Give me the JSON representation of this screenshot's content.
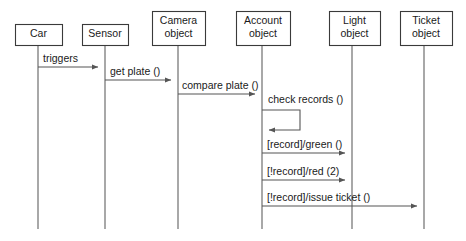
{
  "diagram": {
    "type": "uml-sequence-diagram",
    "title": "",
    "colors": {
      "background": "#ffffff",
      "box_stroke": "#3a3a3a",
      "lifeline_stroke": "#6e6e6e",
      "message_stroke": "#555555",
      "text": "#1a1a1a"
    },
    "participants": [
      {
        "id": "car",
        "label_lines": [
          "Car"
        ],
        "box": {
          "x": 15,
          "y": 24,
          "w": 47,
          "h": 21
        },
        "lifeline_x": 38,
        "lifeline_bottom": 229
      },
      {
        "id": "sensor",
        "label_lines": [
          "Sensor"
        ],
        "box": {
          "x": 82,
          "y": 24,
          "w": 46,
          "h": 21
        },
        "lifeline_x": 105,
        "lifeline_bottom": 229
      },
      {
        "id": "camera-object",
        "label_lines": [
          "Camera",
          "object"
        ],
        "box": {
          "x": 152,
          "y": 11,
          "w": 53,
          "h": 34
        },
        "lifeline_x": 178,
        "lifeline_bottom": 229
      },
      {
        "id": "account-object",
        "label_lines": [
          "Account",
          "object"
        ],
        "box": {
          "x": 236,
          "y": 11,
          "w": 54,
          "h": 34
        },
        "lifeline_x": 262,
        "lifeline_bottom": 229
      },
      {
        "id": "light-object",
        "label_lines": [
          "Light",
          "object"
        ],
        "box": {
          "x": 329,
          "y": 11,
          "w": 51,
          "h": 34
        },
        "lifeline_x": 352,
        "lifeline_bottom": 229
      },
      {
        "id": "ticket-object",
        "label_lines": [
          "Ticket",
          "object"
        ],
        "box": {
          "x": 400,
          "y": 11,
          "w": 52,
          "h": 34
        },
        "lifeline_x": 424,
        "lifeline_bottom": 229
      }
    ],
    "messages": [
      {
        "id": "msg-triggers",
        "label": "triggers",
        "from": "car",
        "to": "sensor",
        "from_x": 38,
        "to_x": 105,
        "y": 67,
        "label_x": 43,
        "label_y": 62,
        "kind": "call"
      },
      {
        "id": "msg-get-plate",
        "label": "get plate ()",
        "from": "sensor",
        "to": "camera-object",
        "from_x": 105,
        "to_x": 178,
        "y": 80,
        "label_x": 110,
        "label_y": 75,
        "kind": "call"
      },
      {
        "id": "msg-compare-plate",
        "label": "compare plate ()",
        "from": "camera-object",
        "to": "account-object",
        "from_x": 178,
        "to_x": 262,
        "y": 94,
        "label_x": 182,
        "label_y": 89,
        "kind": "call"
      },
      {
        "id": "msg-check-records",
        "label": "check records ()",
        "from": "account-object",
        "to": "account-object",
        "from_x": 262,
        "to_x": 262,
        "y": 110,
        "label_x": 268,
        "label_y": 103,
        "kind": "self",
        "loop_width": 38,
        "loop_height": 20
      },
      {
        "id": "msg-green",
        "label": "[record]/green ()",
        "from": "account-object",
        "to": "light-object",
        "from_x": 262,
        "to_x": 352,
        "y": 153,
        "label_x": 267,
        "label_y": 148,
        "kind": "call"
      },
      {
        "id": "msg-red",
        "label": "[!record]/red (2)",
        "from": "account-object",
        "to": "light-object",
        "from_x": 262,
        "to_x": 352,
        "y": 180,
        "label_x": 267,
        "label_y": 175,
        "kind": "call"
      },
      {
        "id": "msg-issue-ticket",
        "label": "[!record]/issue ticket ()",
        "from": "account-object",
        "to": "ticket-object",
        "from_x": 262,
        "to_x": 424,
        "y": 206,
        "label_x": 267,
        "label_y": 201,
        "kind": "call"
      }
    ]
  }
}
